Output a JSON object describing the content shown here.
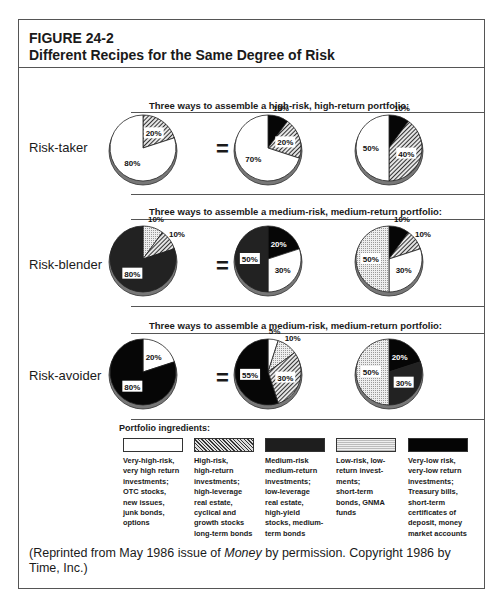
{
  "figure": {
    "number": "FIGURE 24-2",
    "title": "Different Recipes for the Same Degree of Risk"
  },
  "chart_data": {
    "type": "pie",
    "title": "Different Recipes for the Same Degree of Risk",
    "categories": [
      "Very-high-risk",
      "High-risk",
      "Medium-risk",
      "Low-risk",
      "Very-low risk"
    ],
    "rows": [
      {
        "label": "Risk-taker",
        "heading": "Three ways to assemble a high-risk, high-return portfolio:",
        "pies": [
          {
            "slices": [
              {
                "category": "High-risk",
                "value": 20
              },
              {
                "category": "Very-high-risk",
                "value": 80
              }
            ]
          },
          {
            "slices": [
              {
                "category": "Very-low risk",
                "value": 10
              },
              {
                "category": "High-risk",
                "value": 20
              },
              {
                "category": "Very-high-risk",
                "value": 70
              }
            ]
          },
          {
            "slices": [
              {
                "category": "Very-low risk",
                "value": 10
              },
              {
                "category": "High-risk",
                "value": 40
              },
              {
                "category": "Very-high-risk",
                "value": 50
              }
            ]
          }
        ]
      },
      {
        "label": "Risk-blender",
        "heading": "Three ways to assemble a medium-risk, medium-return portfolio:",
        "pies": [
          {
            "slices": [
              {
                "category": "Low-risk",
                "value": 10
              },
              {
                "category": "High-risk",
                "value": 10
              },
              {
                "category": "Medium-risk",
                "value": 80
              }
            ]
          },
          {
            "slices": [
              {
                "category": "Very-low risk",
                "value": 20
              },
              {
                "category": "Very-high-risk",
                "value": 30
              },
              {
                "category": "Medium-risk",
                "value": 50
              }
            ]
          },
          {
            "slices": [
              {
                "category": "Very-low risk",
                "value": 10
              },
              {
                "category": "High-risk",
                "value": 10
              },
              {
                "category": "Very-high-risk",
                "value": 30
              },
              {
                "category": "Low-risk",
                "value": 50
              }
            ]
          }
        ]
      },
      {
        "label": "Risk-avoider",
        "heading": "Three ways to assemble a medium-risk, medium-return portfolio:",
        "pies": [
          {
            "slices": [
              {
                "category": "Very-high-risk",
                "value": 20
              },
              {
                "category": "Very-low risk",
                "value": 80
              }
            ]
          },
          {
            "slices": [
              {
                "category": "Very-high-risk",
                "value": 5
              },
              {
                "category": "Low-risk",
                "value": 10
              },
              {
                "category": "High-risk",
                "value": 30
              },
              {
                "category": "Very-low risk",
                "value": 55
              }
            ]
          },
          {
            "slices": [
              {
                "category": "Very-low risk",
                "value": 20
              },
              {
                "category": "Medium-risk",
                "value": 30
              },
              {
                "category": "Low-risk",
                "value": 50
              }
            ]
          }
        ]
      }
    ],
    "legend_position": "bottom"
  },
  "rows": [
    {
      "label": "Risk-taker",
      "heading": "Three ways to assemble a high-risk, high-return portfolio:"
    },
    {
      "label": "Risk-blender",
      "heading": "Three ways to assemble a medium-risk, medium-return portfolio:"
    },
    {
      "label": "Risk-avoider",
      "heading": "Three ways to assemble a medium-risk, medium-return portfolio:"
    }
  ],
  "equals": "=",
  "legend": {
    "title": "Portfolio ingredients:",
    "items": [
      {
        "key": "vhr",
        "lines": [
          "Very-high-risk,",
          "very high return",
          "investments;",
          "OTC stocks,",
          "new issues,",
          "junk bonds,",
          "options"
        ]
      },
      {
        "key": "hr",
        "lines": [
          "High-risk,",
          "high-return",
          "investments;",
          "high-leverage",
          "real estate,",
          "cyclical and",
          "growth stocks",
          "long-term bonds"
        ]
      },
      {
        "key": "mr",
        "lines": [
          "Medium-risk",
          "medium-return",
          "investments;",
          "low-leverage",
          "real estate,",
          "high-yield",
          "stocks, medium-",
          "term bonds"
        ]
      },
      {
        "key": "lr",
        "lines": [
          "Low-risk, low-",
          "return invest-",
          "ments;",
          "short-term",
          "bonds, GNMA",
          "funds"
        ]
      },
      {
        "key": "vlr",
        "lines": [
          "Very-low risk,",
          "very-low return",
          "investments;",
          "Treasury bills,",
          "short-term",
          "certificates of",
          "deposit, money",
          "market accounts"
        ]
      }
    ]
  },
  "footnote": {
    "before": "(Reprinted from May 1986 issue of ",
    "italic": "Money",
    "after": " by permission. Copyright 1986 by Time, Inc.)"
  }
}
